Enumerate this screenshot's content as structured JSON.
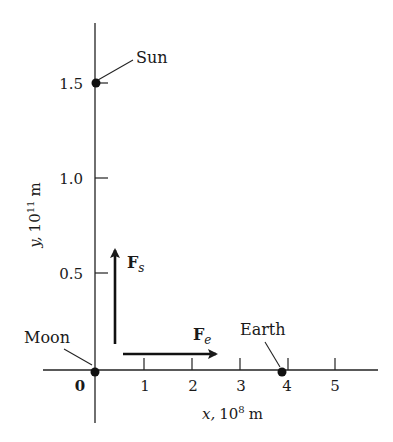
{
  "figure": {
    "y_axis": {
      "label_var": "y,",
      "label_unit": "10",
      "label_exp": "11",
      "label_m": "m",
      "ticks": [
        {
          "value": 0.5,
          "label": "0.5"
        },
        {
          "value": 1.0,
          "label": "1.0"
        },
        {
          "value": 1.5,
          "label": "1.5"
        }
      ]
    },
    "x_axis": {
      "label_var": "x,",
      "label_unit": "10",
      "label_exp": "8",
      "label_m": "m",
      "ticks": [
        {
          "value": 0,
          "label": "0"
        },
        {
          "value": 1,
          "label": "1"
        },
        {
          "value": 2,
          "label": "2"
        },
        {
          "value": 3,
          "label": "3"
        },
        {
          "value": 4,
          "label": "4"
        },
        {
          "value": 5,
          "label": "5"
        }
      ]
    },
    "bodies": [
      {
        "name": "Sun",
        "x": 0,
        "y": 1.5
      },
      {
        "name": "Moon",
        "x": 0,
        "y": 0
      },
      {
        "name": "Earth",
        "x": 3.9,
        "y": 0
      }
    ],
    "forces": [
      {
        "symbol": "F",
        "subscript": "s",
        "direction": "up"
      },
      {
        "symbol": "F",
        "subscript": "e",
        "direction": "right"
      }
    ]
  }
}
